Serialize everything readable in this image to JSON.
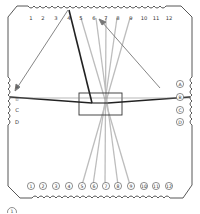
{
  "board": {
    "top_labels": [
      "1",
      "2",
      "3",
      "4",
      "5",
      "6",
      "7",
      "8",
      "9",
      "10",
      "11",
      "12"
    ],
    "bottom_labels": [
      "1",
      "2",
      "3",
      "4",
      "5",
      "6",
      "7",
      "8",
      "9",
      "10",
      "11",
      "12"
    ],
    "left_labels": [
      "A",
      "B",
      "C",
      "D"
    ],
    "right_labels": [
      "A",
      "B",
      "C",
      "D"
    ],
    "top_label_style": "plain",
    "bottom_label_style": "circled",
    "left_label_style": "plain",
    "right_label_style": "circled"
  },
  "center_box": {
    "x": 79,
    "y": 93,
    "width": 43,
    "height": 22
  },
  "strands": {
    "light": [
      {
        "from": "top-5",
        "to": "bottom-9"
      },
      {
        "from": "top-6",
        "to": "bottom-8"
      },
      {
        "from": "top-7",
        "to": "bottom-7"
      },
      {
        "from": "top-8",
        "to": "bottom-6"
      },
      {
        "from": "top-9",
        "to": "bottom-5"
      }
    ],
    "dark": [
      {
        "from": "top-4",
        "to": "center"
      },
      {
        "from": "left-B",
        "to": "center"
      },
      {
        "from": "center",
        "to": "right-B"
      }
    ],
    "arrows": [
      {
        "from": "top-4",
        "to": "left-A"
      },
      {
        "from": "right-A",
        "to": "top-6"
      }
    ]
  },
  "colors": {
    "outline": "#444444",
    "dark_strand": "#222222",
    "light_strand": "#bdbdbd",
    "arrow": "#777777"
  },
  "footer": {
    "marker_label": "1"
  }
}
